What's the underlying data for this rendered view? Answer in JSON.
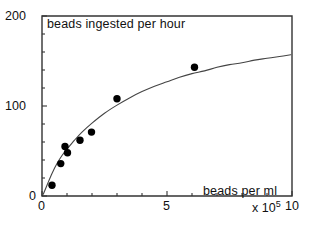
{
  "chart_data": {
    "type": "scatter",
    "title": "beads ingested per hour",
    "xlabel": "beads per ml",
    "ylabel": "beads ingested per hour",
    "x_exponent_label": "x 10",
    "x_exponent_value": "5",
    "xlim": [
      0,
      10
    ],
    "ylim": [
      0,
      200
    ],
    "x_ticks_major": [
      0,
      5,
      10
    ],
    "x_tick_labels": [
      "0",
      "5",
      "10"
    ],
    "y_ticks_major": [
      0,
      100,
      200
    ],
    "y_tick_labels": [
      "0",
      "100",
      "200"
    ],
    "x_minor_tick_step": 1,
    "y_minor_tick_step": 20,
    "x_units": "beads per ml (x 10^5)",
    "y_units": "beads ingested per hour",
    "grid": false,
    "legend": false,
    "marker": "filled-circle",
    "marker_color": "#000000",
    "curve_color": "#444444",
    "frame_color": "#333333",
    "points": [
      {
        "x": 0.4,
        "y": 12
      },
      {
        "x": 0.75,
        "y": 36
      },
      {
        "x": 0.92,
        "y": 55
      },
      {
        "x": 1.02,
        "y": 48
      },
      {
        "x": 1.52,
        "y": 62
      },
      {
        "x": 1.98,
        "y": 71
      },
      {
        "x": 3.0,
        "y": 108
      },
      {
        "x": 6.1,
        "y": 143
      }
    ],
    "fitted_curve": {
      "description": "saturating hyperbolic fit through data",
      "points": [
        {
          "x": 0.05,
          "y": 2
        },
        {
          "x": 0.2,
          "y": 12
        },
        {
          "x": 0.4,
          "y": 25
        },
        {
          "x": 0.6,
          "y": 36
        },
        {
          "x": 0.8,
          "y": 45
        },
        {
          "x": 1.0,
          "y": 52
        },
        {
          "x": 1.3,
          "y": 62
        },
        {
          "x": 1.6,
          "y": 71
        },
        {
          "x": 2.0,
          "y": 81
        },
        {
          "x": 2.5,
          "y": 92
        },
        {
          "x": 3.0,
          "y": 101
        },
        {
          "x": 3.5,
          "y": 109
        },
        {
          "x": 4.0,
          "y": 116
        },
        {
          "x": 4.5,
          "y": 122
        },
        {
          "x": 5.0,
          "y": 127
        },
        {
          "x": 5.5,
          "y": 132
        },
        {
          "x": 6.0,
          "y": 136
        },
        {
          "x": 6.5,
          "y": 139
        },
        {
          "x": 7.0,
          "y": 143
        },
        {
          "x": 7.5,
          "y": 146
        },
        {
          "x": 8.0,
          "y": 148
        },
        {
          "x": 8.5,
          "y": 151
        },
        {
          "x": 9.0,
          "y": 153
        },
        {
          "x": 9.5,
          "y": 155
        },
        {
          "x": 9.95,
          "y": 157
        }
      ]
    }
  },
  "labels": {
    "title": "beads ingested per hour",
    "xaxis_title": "beads per ml",
    "y_top": "200",
    "y_mid": "100",
    "y_zero": "0",
    "x_zero": "0",
    "x_five": "5",
    "x_ten": "10",
    "x_exp_base": "x 10",
    "x_exp_power": "5"
  }
}
